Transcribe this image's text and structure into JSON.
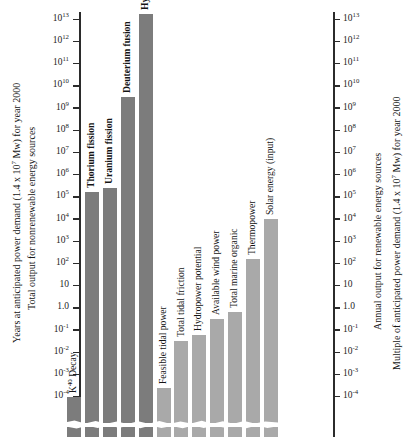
{
  "chart_data": {
    "type": "bar",
    "title": "",
    "scale": "log",
    "ylim": [
      0.0001,
      10000000000000.0
    ],
    "grid": false,
    "legend": "none",
    "left_axis": {
      "caption_outer": "Years at anticipated power demand (1.4 x 10⁷ Mw) for year 2000",
      "caption_inner": "Total output for nonrenewable energy sources",
      "ticks": [
        "10¹³",
        "10¹²",
        "10¹¹",
        "10¹⁰",
        "10⁹",
        "10⁸",
        "10⁷",
        "10⁶",
        "10⁵",
        "10⁴",
        "10³",
        "10²",
        "10",
        "1.0",
        "10⁻¹",
        "10⁻²",
        "10⁻³",
        "10⁻⁴"
      ]
    },
    "right_axis": {
      "caption_inner": "Annual output for renewable energy sources",
      "caption_outer": "Multiple of anticipated power demand (1.4 x 10⁷ Mw) for year 2000",
      "ticks": [
        "10¹³",
        "10¹²",
        "10¹¹",
        "10¹⁰",
        "10⁹",
        "10⁸",
        "10⁷",
        "10⁶",
        "10⁵",
        "10⁴",
        "10³",
        "10²",
        "10",
        "1.0",
        "10⁻¹",
        "10⁻²",
        "10⁻³",
        "10⁻⁴"
      ]
    },
    "tick_exponents": [
      13,
      12,
      11,
      10,
      9,
      8,
      7,
      6,
      5,
      4,
      3,
      2,
      1,
      0,
      -1,
      -2,
      -3,
      -4
    ],
    "tick_labels_plain": [
      "10^13",
      "10^12",
      "10^11",
      "10^10",
      "10^9",
      "10^8",
      "10^7",
      "10^6",
      "10^5",
      "10^4",
      "10^3",
      "10^2",
      "10",
      "1.0",
      "10^-1",
      "10^-2",
      "10^-3",
      "10^-4"
    ],
    "categories": [
      "K⁴⁰ Decay",
      "Thorium fission",
      "Uranium fission",
      "Deuterium fusion",
      "Hydrogen fusion",
      "Feasible tidal power",
      "Total tidal friction",
      "Hydropower potential",
      "Available wind power",
      "Total marine organic",
      "Thermopower",
      "Solar energy (input)"
    ],
    "values": [
      0.0001,
      160000.0,
      250000.0,
      3000000000.0,
      20000000000000.0,
      0.00025,
      0.032,
      0.063,
      0.32,
      0.63,
      160.0,
      10000.0
    ],
    "value_exponents": [
      -4.0,
      5.2,
      5.4,
      9.48,
      13.3,
      -3.6,
      -1.5,
      -1.2,
      -0.5,
      -0.2,
      2.2,
      4.0
    ],
    "group": [
      "nonrenewable",
      "nonrenewable",
      "nonrenewable",
      "nonrenewable",
      "nonrenewable",
      "renewable",
      "renewable",
      "renewable",
      "renewable",
      "renewable",
      "renewable",
      "renewable"
    ],
    "colors": {
      "nonrenewable": "#7c7c7c",
      "renewable": "#a9a9a9"
    },
    "label_bold": [
      false,
      true,
      true,
      true,
      true,
      false,
      false,
      false,
      false,
      false,
      false,
      false
    ]
  }
}
